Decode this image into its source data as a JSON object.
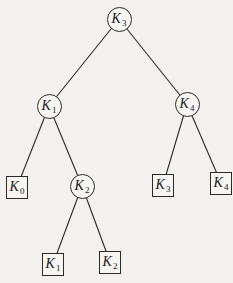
{
  "diagram": {
    "type": "binary-search-tree",
    "line_color": "#2a2a2a",
    "background": "#f2f1ee",
    "nodes": {
      "k3_root": {
        "kind": "internal",
        "letter": "K",
        "sub": "3",
        "cx": 119,
        "cy": 19
      },
      "k1": {
        "kind": "internal",
        "letter": "K",
        "sub": "1",
        "cx": 49,
        "cy": 106
      },
      "k4": {
        "kind": "internal",
        "letter": "K",
        "sub": "4",
        "cx": 187,
        "cy": 104
      },
      "k2": {
        "kind": "internal",
        "letter": "K",
        "sub": "2",
        "cx": 82,
        "cy": 186
      },
      "leaf_k0": {
        "kind": "leaf",
        "letter": "K",
        "sub": "0",
        "cx": 17,
        "cy": 187
      },
      "leaf_k3": {
        "kind": "leaf",
        "letter": "K",
        "sub": "3",
        "cx": 163,
        "cy": 185
      },
      "leaf_k4": {
        "kind": "leaf",
        "letter": "K",
        "sub": "4",
        "cx": 221,
        "cy": 183
      },
      "leaf_k1": {
        "kind": "leaf",
        "letter": "K",
        "sub": "1",
        "cx": 53,
        "cy": 264
      },
      "leaf_k2": {
        "kind": "leaf",
        "letter": "K",
        "sub": "2",
        "cx": 110,
        "cy": 262
      }
    },
    "edges": [
      [
        "k3_root",
        "k1"
      ],
      [
        "k3_root",
        "k4"
      ],
      [
        "k1",
        "leaf_k0"
      ],
      [
        "k1",
        "k2"
      ],
      [
        "k4",
        "leaf_k3"
      ],
      [
        "k4",
        "leaf_k4"
      ],
      [
        "k2",
        "leaf_k1"
      ],
      [
        "k2",
        "leaf_k2"
      ]
    ]
  }
}
